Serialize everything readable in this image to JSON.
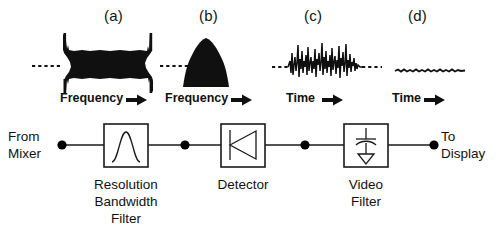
{
  "figure": {
    "background_color": "#ffffff",
    "ink_color": "#101010"
  },
  "panels": [
    {
      "tag": "(a)",
      "axis_label": "Frequency",
      "axis_arrow": "→",
      "waveform": "broadband-noise-spectrum",
      "description": "Wide filled noise band with vertical edge spikes on a dashed baseline"
    },
    {
      "tag": "(b)",
      "axis_label": "Frequency",
      "axis_arrow": "→",
      "waveform": "filtered-bell-spectrum",
      "description": "Single filled bell-shaped response curve"
    },
    {
      "tag": "(c)",
      "axis_label": "Time",
      "axis_arrow": "→",
      "waveform": "detected-noisy-video",
      "description": "Dense spiky noise burst on a dashed baseline"
    },
    {
      "tag": "(d)",
      "axis_label": "Time",
      "axis_arrow": "→",
      "waveform": "smoothed-video",
      "description": "Nearly flat lightly rippled trace"
    }
  ],
  "signal_path": {
    "input_port": {
      "line1": "From",
      "line2": "Mixer"
    },
    "output_port": {
      "line1": "To",
      "line2": "Display"
    },
    "blocks": [
      {
        "id": "resolution-bandwidth-filter",
        "symbol": "bandpass-bell-curve",
        "label_lines": [
          "Resolution",
          "Bandwidth",
          "Filter"
        ]
      },
      {
        "id": "detector",
        "symbol": "diode",
        "label_lines": [
          "Detector"
        ]
      },
      {
        "id": "video-filter",
        "symbol": "capacitor-to-ground",
        "label_lines": [
          "Video",
          "Filter"
        ]
      }
    ],
    "node_count": 5
  }
}
